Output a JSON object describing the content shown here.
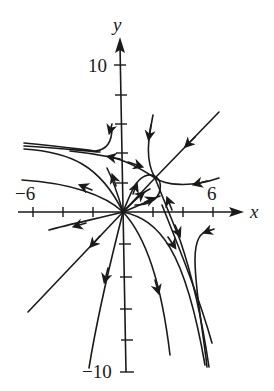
{
  "figure": {
    "type": "phase-portrait",
    "axes": {
      "x_label": "x",
      "y_label": "y",
      "x_tick_labels": {
        "neg": "−6",
        "pos": "6"
      },
      "y_tick_labels": {
        "pos": "10",
        "neg": "−10"
      },
      "x_range": [
        -6,
        6
      ],
      "y_range": [
        -10,
        10
      ],
      "x_tick_step": 2,
      "y_tick_step": 2
    },
    "equilibria": [
      {
        "kind": "unstable-node",
        "x": 0,
        "y": 0
      },
      {
        "kind": "saddle",
        "x": 2,
        "y": 2.3
      }
    ],
    "colors": {
      "ink": "#1a1a1a",
      "background": "#ffffff"
    }
  }
}
